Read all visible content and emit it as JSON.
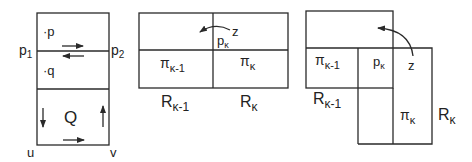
{
  "figure1": {
    "point_p": "·p",
    "point_q": "·q",
    "label_p1": "p",
    "label_p1_sub": "1",
    "label_p2": "p",
    "label_p2_sub": "2",
    "region_Q": "Q",
    "corner_u": "u",
    "corner_v": "v"
  },
  "figure2": {
    "label_z": "z",
    "label_p": "p",
    "label_p_sub": "κ",
    "pi_left": "π",
    "pi_left_sub": "κ-1",
    "pi_right": "π",
    "pi_right_sub": "κ",
    "R_left": "R",
    "R_left_sub": "κ-1",
    "R_right": "R",
    "R_right_sub": "κ"
  },
  "figure3": {
    "label_z": "z",
    "label_p": "p",
    "label_p_sub": "κ",
    "pi_left": "π",
    "pi_left_sub": "κ-1",
    "pi_right": "π",
    "pi_right_sub": "κ",
    "R_left": "R",
    "R_left_sub": "κ-1",
    "R_right": "R",
    "R_right_sub": "κ"
  }
}
